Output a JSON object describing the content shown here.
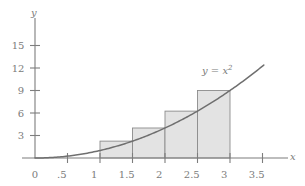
{
  "chart_data": {
    "type": "area",
    "title": "",
    "subtitle": "",
    "xlabel": "x",
    "ylabel": "y",
    "xlim": [
      -0.12,
      3.85
    ],
    "ylim": [
      -0.9,
      17.2
    ],
    "grid": false,
    "legend": "none",
    "curve": {
      "label": "y = x",
      "label_exponent": "2",
      "equation": "y = x^2",
      "x_start": 0,
      "x_end": 3.52,
      "color": "#6f6f6f"
    },
    "riemann": {
      "method": "right-endpoint",
      "interval": [
        1,
        3
      ],
      "n": 4,
      "width": 0.5,
      "fill_color": "#e3e3e3",
      "edge_color": "#8c8c8c",
      "bars": [
        {
          "x_left": 1.0,
          "x_right": 1.5,
          "height": 2.25
        },
        {
          "x_left": 1.5,
          "x_right": 2.0,
          "height": 4.0
        },
        {
          "x_left": 2.0,
          "x_right": 2.5,
          "height": 6.25
        },
        {
          "x_left": 2.5,
          "x_right": 3.0,
          "height": 9.0
        }
      ]
    },
    "x_ticks": [
      {
        "value": 0,
        "label": "0"
      },
      {
        "value": 0.5,
        "label": ".5"
      },
      {
        "value": 1,
        "label": "1"
      },
      {
        "value": 1.5,
        "label": "1.5"
      },
      {
        "value": 2,
        "label": "2"
      },
      {
        "value": 2.5,
        "label": "2.5"
      },
      {
        "value": 3,
        "label": "3"
      },
      {
        "value": 3.5,
        "label": "3.5"
      }
    ],
    "y_ticks": [
      {
        "value": 3,
        "label": "3"
      },
      {
        "value": 6,
        "label": "6"
      },
      {
        "value": 9,
        "label": "9"
      },
      {
        "value": 12,
        "label": "12"
      },
      {
        "value": 15,
        "label": "15"
      }
    ],
    "axis_color": "#7d7d7d",
    "text_color": "#7b7b7b"
  },
  "labels": {
    "y_axis_name": "y",
    "x_axis_name": "x",
    "curve_text": "y = x",
    "curve_exponent": "2",
    "origin": "0",
    "x_tick_0": "0",
    "x_tick_1": ".5",
    "x_tick_2": "1",
    "x_tick_3": "1.5",
    "x_tick_4": "2",
    "x_tick_5": "2.5",
    "x_tick_6": "3",
    "x_tick_7": "3.5",
    "y_tick_0": "3",
    "y_tick_1": "6",
    "y_tick_2": "9",
    "y_tick_3": "12",
    "y_tick_4": "15"
  }
}
